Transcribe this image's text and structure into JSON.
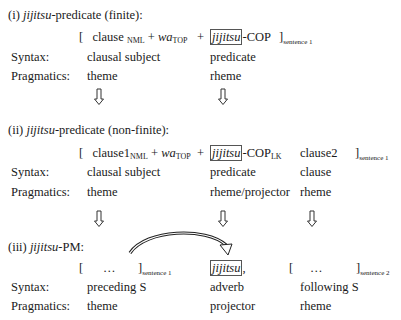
{
  "section_i": {
    "heading_num": "(i) ",
    "heading_term": "jijitsu",
    "heading_rest": "-predicate (finite):",
    "open_bracket": "[",
    "clause": "clause",
    "nml": "NML",
    "plus1": "+",
    "wa": "wa",
    "top": "TOP",
    "plus2": "+",
    "boxed_term": "jijitsu",
    "cop": "-COP",
    "close_bracket": "]",
    "sentence_label": "sentence 1",
    "syntax_label": "Syntax:",
    "syntax": [
      "clausal subject",
      "predicate"
    ],
    "pragmatics_label": "Pragmatics:",
    "pragmatics": [
      "theme",
      "rheme"
    ]
  },
  "section_ii": {
    "heading_num": "(ii) ",
    "heading_term": "jijitsu",
    "heading_rest": "-predicate (non-finite):",
    "open_bracket": "[",
    "clause": "clause1",
    "nml": "NML",
    "plus1": "+",
    "wa": "wa",
    "top": "TOP",
    "plus2": "+",
    "boxed_term": "jijitsu",
    "cop": "-COP",
    "lk": "LK",
    "clause2": "clause2",
    "close_bracket": "]",
    "sentence_label": "sentence 1",
    "syntax_label": "Syntax:",
    "syntax": [
      "clausal subject",
      "predicate",
      "clause"
    ],
    "pragmatics_label": "Pragmatics:",
    "pragmatics": [
      "theme",
      "rheme/projector",
      "rheme"
    ]
  },
  "section_iii": {
    "heading_num": "(iii) ",
    "heading_term": "jijitsu",
    "heading_rest": "-PM:",
    "open_bracket1": "[",
    "ellipsis1": "…",
    "close_bracket1": "]",
    "sentence1_label": "sentence 1",
    "boxed_term": "jijitsu",
    "comma": ",",
    "open_bracket2": "[",
    "ellipsis2": "…",
    "close_bracket2": "]",
    "sentence2_label": "sentence 2",
    "syntax_label": "Syntax:",
    "syntax": [
      "preceding S",
      "adverb",
      "following S"
    ],
    "pragmatics_label": "Pragmatics:",
    "pragmatics": [
      "theme",
      "projector",
      "rheme"
    ]
  },
  "arrows": {
    "glyph": "down-hollow-arrow",
    "curved": "curved-arrow-preceding-to-jijitsu"
  }
}
